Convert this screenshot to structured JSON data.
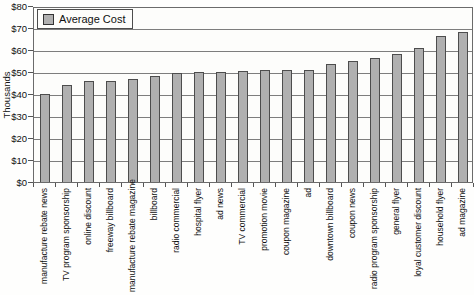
{
  "legend": {
    "label": "Average Cost"
  },
  "y_axis": {
    "title": "Thousands"
  },
  "chart_data": {
    "type": "bar",
    "title": "",
    "legend_label": "Average Cost",
    "legend_position": "top-left",
    "xlabel": "",
    "ylabel": "Thousands",
    "ylim": [
      0,
      80
    ],
    "ytick_step": 10,
    "y_tick_labels": [
      "$0",
      "$10",
      "$20",
      "$30",
      "$40",
      "$50",
      "$60",
      "$70",
      "$80"
    ],
    "grid": true,
    "categories": [
      "manufacture rebate news",
      "TV program sponsorship",
      "online discount",
      "freeway billboard",
      "manufacture rebate magazine",
      "billboard",
      "radio commercial",
      "hospital flyer",
      "ad news",
      "TV commercial",
      "promotion movie",
      "coupon magazine",
      "ad",
      "downtown billboard",
      "coupon news",
      "radio program sponsorship",
      "general flyer",
      "loyal customer discount",
      "household flyer",
      "ad magazine"
    ],
    "values": [
      40,
      44,
      46,
      46,
      47,
      48,
      49.5,
      50,
      50,
      50.5,
      51,
      51,
      51,
      53.5,
      55,
      56.5,
      58,
      61,
      66.5,
      68
    ],
    "colors": {
      "bar_fill": "#b0b0b0",
      "bar_border": "#4d4d4d",
      "gridline": "#7d7d7d",
      "axis": "#545454",
      "plot_background": "#fdfdfb",
      "page_background": "#fefefd"
    }
  }
}
